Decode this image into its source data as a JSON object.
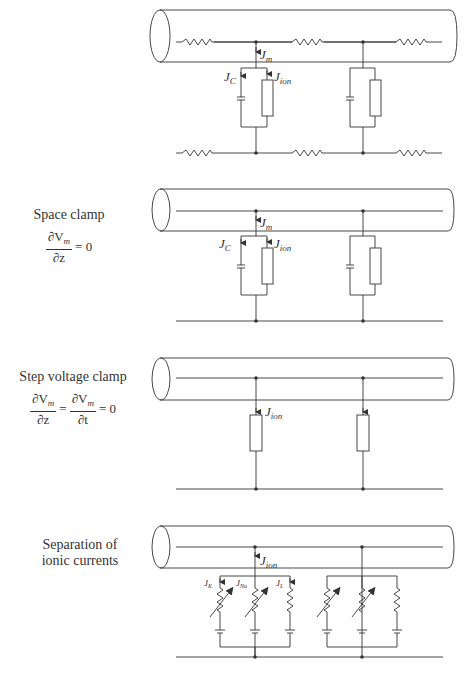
{
  "panels": [
    {
      "id": "cable-model",
      "title": "",
      "equation": "",
      "labels": {
        "jm": "J",
        "jm_sub": "m",
        "jc": "J",
        "jc_sub": "C",
        "jion": "J",
        "jion_sub": "ion"
      }
    },
    {
      "id": "space-clamp",
      "title": "Space clamp",
      "equation": {
        "num": "∂V",
        "num_sub": "m",
        "den": "∂z",
        "rhs": "= 0"
      },
      "labels": {
        "jm": "J",
        "jm_sub": "m",
        "jc": "J",
        "jc_sub": "C",
        "jion": "J",
        "jion_sub": "ion"
      }
    },
    {
      "id": "step-voltage-clamp",
      "title": "Step voltage clamp",
      "equation": {
        "num1": "∂V",
        "num1_sub": "m",
        "den1": "∂z",
        "mid": "=",
        "num2": "∂V",
        "num2_sub": "m",
        "den2": "∂t",
        "rhs": "= 0"
      },
      "labels": {
        "jion": "J",
        "jion_sub": "ion"
      }
    },
    {
      "id": "separation-ionic-currents",
      "title_line1": "Separation of",
      "title_line2": "ionic currents",
      "labels": {
        "jion": "J",
        "jion_sub": "ion",
        "jk": "J",
        "jk_sub": "K",
        "jna": "J",
        "jna_sub": "Na",
        "jl": "J",
        "jl_sub": "L"
      }
    }
  ],
  "colors": {
    "stroke": "#333333",
    "background": "#ffffff"
  }
}
